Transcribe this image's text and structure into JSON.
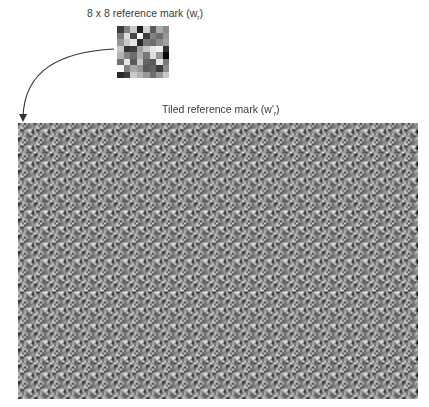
{
  "reference_mark": {
    "title_prefix": "8 x 8 reference mark (w",
    "title_sub": "r",
    "title_suffix": ")",
    "grid_size": 8,
    "gray_levels": [
      [
        60,
        130,
        200,
        30,
        210,
        90,
        170,
        140
      ],
      [
        120,
        220,
        70,
        250,
        60,
        130,
        110,
        150
      ],
      [
        150,
        200,
        230,
        40,
        120,
        110,
        140,
        160
      ],
      [
        200,
        50,
        60,
        160,
        200,
        230,
        240,
        50
      ],
      [
        180,
        130,
        110,
        170,
        120,
        220,
        150,
        10
      ],
      [
        110,
        230,
        90,
        200,
        100,
        90,
        230,
        120
      ],
      [
        250,
        130,
        170,
        150,
        90,
        100,
        60,
        140
      ],
      [
        40,
        60,
        200,
        180,
        150,
        110,
        150,
        200
      ]
    ]
  },
  "tiled_mark": {
    "title_prefix": "Tiled reference mark (w'",
    "title_sub": "r",
    "title_suffix": ")",
    "tiles_x": 25,
    "tiles_y": 17
  },
  "arrow": {
    "from": "reference-mark",
    "to": "tiled-reference-mark",
    "color": "#333333"
  }
}
